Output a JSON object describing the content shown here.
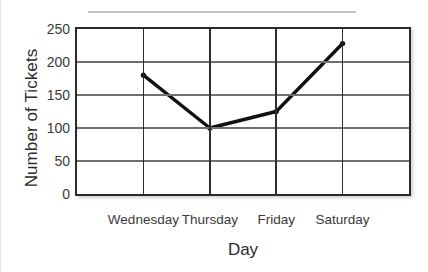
{
  "chart_data": {
    "type": "line",
    "title": "",
    "xlabel": "Day",
    "ylabel": "Number of Tickets",
    "categories": [
      "Wednesday",
      "Thursday",
      "Friday",
      "Saturday"
    ],
    "values": [
      180,
      100,
      125,
      228
    ],
    "series": [
      {
        "name": "Number of Tickets",
        "values": [
          180,
          100,
          125,
          228
        ]
      }
    ],
    "ylim": [
      0,
      250
    ],
    "yticks": [
      0,
      50,
      100,
      150,
      200,
      250
    ],
    "ytick_labels": [
      "0",
      "50",
      "100",
      "150",
      "200",
      "250"
    ],
    "grid": "both",
    "legend": "none",
    "line_color": "#111111",
    "grid_color": "#6f6f6f",
    "axis_color": "#2a2a2a",
    "marker": "dot"
  }
}
